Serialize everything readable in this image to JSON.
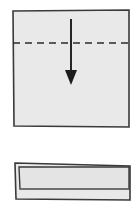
{
  "diagram": {
    "title": "Origami fold step diagram",
    "type": "origami-instruction",
    "step_count": 2,
    "canvas": {
      "width": 140,
      "height": 208,
      "background": "#ffffff"
    },
    "colors": {
      "paper_fill": "#e9e9e9",
      "paper_fill_shaded": "#e4e4e4",
      "outline": "#3a3a3a",
      "fold_line": "#2b2b2b",
      "arrow": "#1c1c1c",
      "crease": "#7d7d7d"
    },
    "panels": [
      {
        "id": "before-fold",
        "label": "square sheet with horizontal valley fold",
        "shape": "square",
        "outline_points": "13,11 129,10 129,127 14,126",
        "fold_line": {
          "kind": "valley-fold",
          "style": "dashed",
          "orientation": "horizontal",
          "x1": 13,
          "y1": 43,
          "x2": 129,
          "y2": 43,
          "dash_length": 7,
          "gap_length": 5
        },
        "arrow": {
          "kind": "fold-direction-arrow",
          "direction": "down",
          "shaft": {
            "x1": 71,
            "y1": 19,
            "x2": 71,
            "y2": 72
          },
          "head_points": "65,70 77,70 71,85"
        }
      },
      {
        "id": "after-fold",
        "label": "resulting folded rectangle with visible flap",
        "shape": "rectangle",
        "outline_points": "15,163 130,166 130,200 16,199",
        "flap_points": "19,167 129,167 129,189 20,189",
        "crease_line": {
          "x1": 20,
          "y1": 189,
          "x2": 129,
          "y2": 189
        }
      }
    ]
  }
}
